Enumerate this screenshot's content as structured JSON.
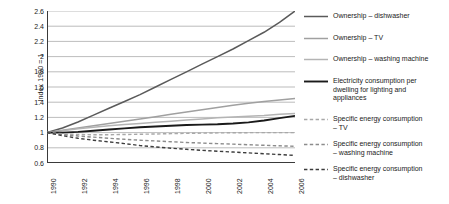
{
  "chart_data": {
    "type": "line",
    "title": "",
    "subtitle": "",
    "xlabel": "",
    "ylabel": "Index 1990 = 1",
    "xlim": [
      1990,
      2006
    ],
    "ylim": [
      0.6,
      2.6
    ],
    "ytick_labels": [
      "2.6",
      "2.4",
      "2.2",
      "2",
      "1.8",
      "1.6",
      "1.4",
      "1.2",
      "1",
      "0.8",
      "0.6"
    ],
    "ytick_values": [
      2.6,
      2.4,
      2.2,
      2.0,
      1.8,
      1.6,
      1.4,
      1.2,
      1.0,
      0.8,
      0.6
    ],
    "xtick_labels": [
      "1990",
      "1992",
      "1994",
      "1996",
      "1998",
      "2000",
      "2002",
      "2004",
      "2006"
    ],
    "xtick_values": [
      1990,
      1992,
      1994,
      1996,
      1998,
      2000,
      2002,
      2004,
      2006
    ],
    "minor_xticks": [
      1991,
      1993,
      1995,
      1997,
      1999,
      2001,
      2003,
      2005
    ],
    "grid": "horizontal",
    "legend_position": "right",
    "x": [
      1990,
      1991,
      1992,
      1993,
      1994,
      1995,
      1996,
      1997,
      1998,
      1999,
      2000,
      2001,
      2002,
      2003,
      2004,
      2005,
      2006
    ],
    "series": [
      {
        "name": "Ownership – dishwasher",
        "style": "solid",
        "color": "#5a5a5a",
        "width": 1.5,
        "values": [
          1.0,
          1.06,
          1.14,
          1.23,
          1.32,
          1.41,
          1.5,
          1.6,
          1.7,
          1.8,
          1.9,
          2.0,
          2.1,
          2.21,
          2.32,
          2.45,
          2.6
        ]
      },
      {
        "name": "Ownership – TV",
        "style": "solid",
        "color": "#a0a0a0",
        "width": 1.5,
        "values": [
          1.0,
          1.03,
          1.06,
          1.09,
          1.12,
          1.15,
          1.18,
          1.21,
          1.24,
          1.27,
          1.3,
          1.33,
          1.36,
          1.385,
          1.41,
          1.43,
          1.45
        ]
      },
      {
        "name": "Ownership – washing machine",
        "style": "solid",
        "color": "#b4b4b4",
        "width": 1.5,
        "values": [
          1.0,
          1.025,
          1.05,
          1.07,
          1.09,
          1.105,
          1.12,
          1.135,
          1.15,
          1.165,
          1.18,
          1.195,
          1.205,
          1.215,
          1.225,
          1.24,
          1.25
        ]
      },
      {
        "name": "Electricity consumption per dwelling for lighting and appliances",
        "style": "solid",
        "color": "#1a1a1a",
        "width": 1.9,
        "values": [
          1.0,
          1.0,
          1.01,
          1.025,
          1.04,
          1.055,
          1.07,
          1.08,
          1.09,
          1.1,
          1.105,
          1.11,
          1.12,
          1.135,
          1.16,
          1.19,
          1.22
        ]
      },
      {
        "name": "Specific energy consumption – TV",
        "style": "dashed",
        "color": "#a8a8a8",
        "width": 1.4,
        "values": [
          1.0,
          0.985,
          0.975,
          0.972,
          0.972,
          0.975,
          0.978,
          0.982,
          0.986,
          0.99,
          0.993,
          0.996,
          0.998,
          0.999,
          1.0,
          1.0,
          1.0
        ]
      },
      {
        "name": "Specific energy consumption – washing machine",
        "style": "dashed",
        "color": "#8c8c8c",
        "width": 1.4,
        "values": [
          1.0,
          0.975,
          0.955,
          0.94,
          0.925,
          0.912,
          0.9,
          0.89,
          0.88,
          0.87,
          0.862,
          0.855,
          0.848,
          0.84,
          0.833,
          0.826,
          0.82
        ]
      },
      {
        "name": "Specific energy consumption – dishwasher",
        "style": "dashed",
        "color": "#3c3c3c",
        "width": 1.4,
        "values": [
          1.0,
          0.96,
          0.925,
          0.9,
          0.878,
          0.855,
          0.83,
          0.812,
          0.795,
          0.78,
          0.767,
          0.755,
          0.744,
          0.733,
          0.722,
          0.711,
          0.7
        ]
      }
    ]
  },
  "legend": {
    "entries": [
      {
        "label": "Ownership – dishwasher"
      },
      {
        "label": "Ownership – TV"
      },
      {
        "label": "Ownership – washing machine"
      },
      {
        "label": "Electricity consumption per\ndwelling for lighting and\nappliances"
      },
      {
        "label": "Specific energy consumption\n– TV"
      },
      {
        "label": "Specific energy consumption\n– washing machine"
      },
      {
        "label": "Specific energy consumption\n– dishwasher"
      }
    ]
  }
}
